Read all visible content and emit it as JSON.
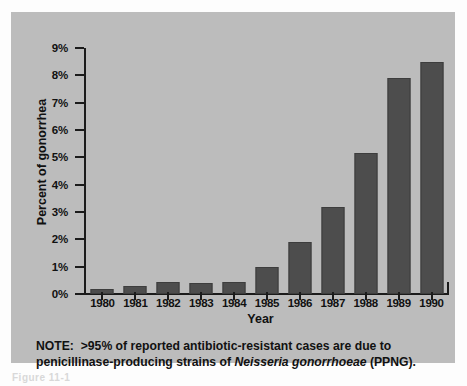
{
  "figure": {
    "panel_background": "#bcbcbc",
    "bar_color": "#4d4d4d",
    "axis_color": "#1b1b1b",
    "caption_stub": "Figure 11-1"
  },
  "note": {
    "lead": "NOTE:",
    "text_before_species": ">95% of reported antibiotic-resistant cases are due to penicillinase-producing strains of",
    "species": "Neisseria gonorrhoeae",
    "text_after_species": "(PPNG)."
  },
  "chart_data": {
    "type": "bar",
    "title": "",
    "xlabel": "Year",
    "ylabel": "Percent of gonorrhea",
    "categories": [
      "1980",
      "1981",
      "1982",
      "1983",
      "1984",
      "1985",
      "1986",
      "1987",
      "1988",
      "1989",
      "1990"
    ],
    "values": [
      0.2,
      0.3,
      0.45,
      0.4,
      0.45,
      1.0,
      1.9,
      3.2,
      5.15,
      7.9,
      8.5
    ],
    "ylim": [
      0,
      9
    ],
    "ytick_values": [
      0,
      1,
      2,
      3,
      4,
      5,
      6,
      7,
      8,
      9
    ],
    "ytick_labels": [
      "0%",
      "1%",
      "2%",
      "3%",
      "4%",
      "5%",
      "6%",
      "7%",
      "8%",
      "9%"
    ],
    "grid": false,
    "legend": null,
    "series": [
      {
        "name": "Percent of gonorrhea",
        "values": [
          0.2,
          0.3,
          0.45,
          0.4,
          0.45,
          1.0,
          1.9,
          3.2,
          5.15,
          7.9,
          8.5
        ]
      }
    ]
  }
}
